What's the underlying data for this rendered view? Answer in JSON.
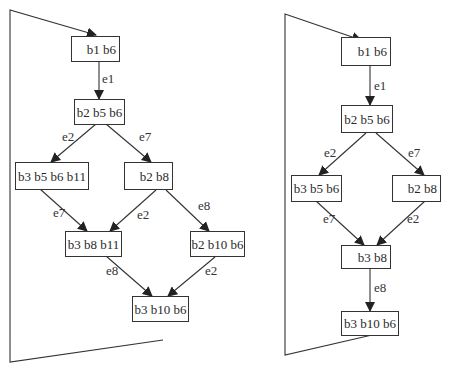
{
  "diagrams": [
    {
      "name": "left-graph",
      "nodes": [
        {
          "id": "n1",
          "label": "b1 b6"
        },
        {
          "id": "n2",
          "label": "b2 b5 b6"
        },
        {
          "id": "n3",
          "label": "b3 b5 b6 b11"
        },
        {
          "id": "n4",
          "label": "b2 b8"
        },
        {
          "id": "n5",
          "label": "b3 b8 b11"
        },
        {
          "id": "n6",
          "label": "b2 b10 b6"
        },
        {
          "id": "n7",
          "label": "b3 b10 b6"
        }
      ],
      "edges": [
        {
          "from": "n1",
          "to": "n2",
          "label": "e1"
        },
        {
          "from": "n2",
          "to": "n3",
          "label": "e2"
        },
        {
          "from": "n2",
          "to": "n4",
          "label": "e7"
        },
        {
          "from": "n3",
          "to": "n5",
          "label": "e7"
        },
        {
          "from": "n4",
          "to": "n5",
          "label": "e2"
        },
        {
          "from": "n4",
          "to": "n6",
          "label": "e8"
        },
        {
          "from": "n5",
          "to": "n7",
          "label": "e8"
        },
        {
          "from": "n6",
          "to": "n7",
          "label": "e2"
        }
      ]
    },
    {
      "name": "right-graph",
      "nodes": [
        {
          "id": "m1",
          "label": "b1 b6"
        },
        {
          "id": "m2",
          "label": "b2 b5 b6"
        },
        {
          "id": "m3",
          "label": "b3 b5 b6"
        },
        {
          "id": "m4",
          "label": "b2 b8"
        },
        {
          "id": "m5",
          "label": "b3 b8"
        },
        {
          "id": "m6",
          "label": "b3 b10 b6"
        }
      ],
      "edges": [
        {
          "from": "m1",
          "to": "m2",
          "label": "e1"
        },
        {
          "from": "m2",
          "to": "m3",
          "label": "e2"
        },
        {
          "from": "m2",
          "to": "m4",
          "label": "e7"
        },
        {
          "from": "m3",
          "to": "m5",
          "label": "e7"
        },
        {
          "from": "m4",
          "to": "m5",
          "label": "e2"
        },
        {
          "from": "m5",
          "to": "m6",
          "label": "e8"
        }
      ]
    }
  ],
  "colors": {
    "stroke": "#333333",
    "background": "#ffffff"
  }
}
